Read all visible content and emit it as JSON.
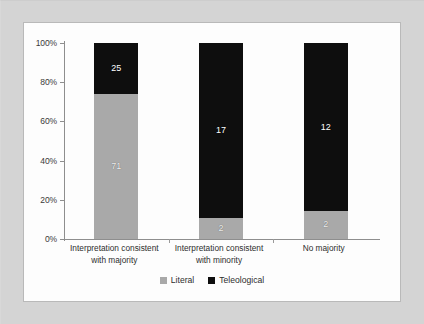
{
  "chart_data": {
    "type": "bar",
    "subtype": "stacked-100-percent",
    "title": "",
    "subtitle": "",
    "xlabel": "",
    "ylabel": "",
    "ylim": [
      0,
      100
    ],
    "grid": false,
    "legend_position": "bottom-center",
    "categories": [
      "Interpretation consistent with majority",
      "Interpretation consistent with minority",
      "No majority"
    ],
    "category_lines": [
      [
        "Interpretation consistent",
        "with majority"
      ],
      [
        "Interpretation consistent",
        "with minority"
      ],
      [
        "No majority",
        ""
      ]
    ],
    "ytick_labels": [
      "0%",
      "20%",
      "40%",
      "60%",
      "80%",
      "100%"
    ],
    "ytick_values": [
      0,
      20,
      40,
      60,
      80,
      100
    ],
    "series": [
      {
        "name": "Literal",
        "color": "#a9a9a9",
        "values": [
          71,
          2,
          2
        ],
        "percents": [
          74.0,
          10.5,
          14.3
        ],
        "labels": [
          "71",
          "2",
          "2"
        ]
      },
      {
        "name": "Teleological",
        "color": "#0e0e0e",
        "values": [
          25,
          17,
          12
        ],
        "percents": [
          26.0,
          89.5,
          85.7
        ],
        "labels": [
          "25",
          "17",
          "12"
        ]
      }
    ],
    "totals": [
      96,
      19,
      14
    ]
  },
  "legend": {
    "items": [
      {
        "label": "Literal",
        "color": "#a9a9a9"
      },
      {
        "label": "Teleological",
        "color": "#0e0e0e"
      }
    ]
  },
  "colors": {
    "literal": "#a9a9a9",
    "teleological": "#0e0e0e",
    "axis": "#8e8e8e",
    "panel_background": "#fdfdfd",
    "outer_background": "#d4d4d4",
    "panel_border": "#b9b9b9",
    "text": "#2d2d2d"
  }
}
